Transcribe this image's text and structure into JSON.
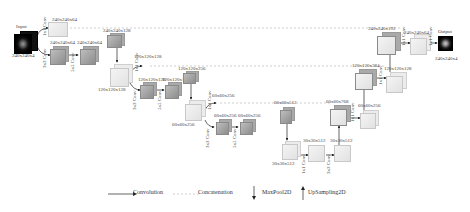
{
  "diagram": {
    "type": "U-Net architecture",
    "input": {
      "title": "Input",
      "shape": "240x240x4"
    },
    "output": {
      "title": "Output",
      "shape": "240x240x4"
    },
    "encoder": [
      {
        "id": "e1a",
        "shape": "240x240x64"
      },
      {
        "id": "e1b",
        "shape": "240x240x64"
      },
      {
        "id": "e1c",
        "shape": "240x240x64"
      },
      {
        "id": "e2in",
        "shape": "120x120x128"
      },
      {
        "id": "e2a",
        "shape": "120x120x128"
      },
      {
        "id": "e2b",
        "shape": "120x120x128"
      },
      {
        "id": "e2c",
        "shape": "120x120x128"
      },
      {
        "id": "e3in",
        "shape": "60x60x256"
      },
      {
        "id": "e3a",
        "shape": "60x60x256"
      },
      {
        "id": "e3b",
        "shape": "60x60x256"
      },
      {
        "id": "e3c",
        "shape": "60x60x256"
      },
      {
        "id": "e4in",
        "shape": "30x30x512"
      },
      {
        "id": "e4a",
        "shape": "30x30x512"
      },
      {
        "id": "e4b",
        "shape": "30x30x512"
      }
    ],
    "skip_tops": [
      {
        "id": "s1",
        "shape": "240x240x128"
      },
      {
        "id": "s2",
        "shape": "120x120x256"
      },
      {
        "id": "s3",
        "shape": "60x60x512"
      }
    ],
    "decoder": [
      {
        "id": "d3cat",
        "shape": "60x60x768"
      },
      {
        "id": "d3a",
        "shape": "60x60x256"
      },
      {
        "id": "d2cat",
        "shape": "120x120x384"
      },
      {
        "id": "d2a",
        "shape": "120x120x128"
      },
      {
        "id": "d1cat",
        "shape": "240x240x192"
      },
      {
        "id": "d1a",
        "shape": "240x240x64"
      }
    ],
    "conv_labels": {
      "c1x1": "1x1 Conv",
      "c3x3": "3x3 Conv",
      "c5x5": "5x5 Conv",
      "c7x7": "7x7 Conv",
      "c1x1b": "1x1 Conv"
    }
  },
  "legend": {
    "convolution": "Convolution",
    "concatenation": "Concatenation",
    "maxpool": "MaxPool2D",
    "upsampling": "UpSampling2D"
  },
  "colors": {
    "dark_cube": "#9e9e9e",
    "light_cube": "#ebebeb",
    "line": "#333333",
    "concat_line": "#cccccc"
  }
}
